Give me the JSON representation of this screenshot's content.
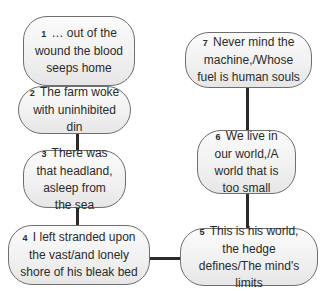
{
  "diagram": {
    "type": "flowchart",
    "nodes": [
      {
        "num": "1",
        "text": "… out of the wound the blood seeps home"
      },
      {
        "num": "2",
        "text": "The farm woke with uninhibited din"
      },
      {
        "num": "3",
        "text": "There was that headland, asleep from the sea"
      },
      {
        "num": "4",
        "text": "I left stranded upon the vast/and lonely shore of his bleak bed"
      },
      {
        "num": "5",
        "text": "This is his world, the hedge defines/The mind's limits"
      },
      {
        "num": "6",
        "text": "We live in our world,/A world that is too small"
      },
      {
        "num": "7",
        "text": "Never mind the machine,/Whose fuel is human souls"
      }
    ],
    "edges": [
      [
        "1",
        "2"
      ],
      [
        "2",
        "3"
      ],
      [
        "3",
        "4"
      ],
      [
        "4",
        "5"
      ],
      [
        "5",
        "6"
      ],
      [
        "6",
        "7"
      ]
    ],
    "colors": {
      "node_fill": "#f0f0f0",
      "node_border": "#6e6e6e",
      "connector": "#2a2a2a",
      "text": "#2a2a2a"
    }
  }
}
